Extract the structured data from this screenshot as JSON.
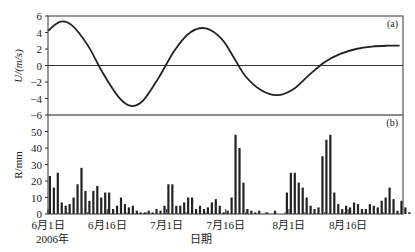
{
  "chart_data": [
    {
      "panel": "(a)",
      "type": "line",
      "ylabel": "U/(m/s)",
      "ylim": [
        -6,
        6
      ],
      "yticks": [
        6,
        4,
        2,
        0,
        -2,
        -4,
        -6
      ],
      "x_unit": "day since 2006-06-01",
      "x": [
        0,
        3,
        6,
        10,
        14,
        18,
        21,
        24,
        28,
        32,
        36,
        40,
        44,
        47,
        50,
        54,
        58,
        62,
        66,
        70,
        74,
        78,
        82,
        86,
        89
      ],
      "y": [
        4.2,
        5.3,
        4.9,
        2.5,
        -1.0,
        -3.9,
        -4.9,
        -4.3,
        -1.5,
        1.8,
        4.0,
        4.5,
        3.2,
        1.0,
        -1.3,
        -3.0,
        -3.6,
        -2.9,
        -1.2,
        0.4,
        1.4,
        2.0,
        2.3,
        2.4,
        2.4
      ],
      "reference_line": 0,
      "color": "#222222"
    },
    {
      "panel": "(b)",
      "type": "bar",
      "ylabel": "R/mm",
      "ylim": [
        0,
        60
      ],
      "yticks": [
        50,
        40,
        30,
        20,
        10,
        0
      ],
      "xlabel": "日期",
      "xtick_labels": [
        "6月1日",
        "6月16日",
        "7月1日",
        "7月16日",
        "8月1日",
        "8月16日"
      ],
      "xtick_days": [
        0,
        15,
        30,
        45,
        61,
        76
      ],
      "year_label": "2006年",
      "values": [
        23,
        16,
        25,
        7,
        5,
        6,
        10,
        18,
        28,
        14,
        8,
        14,
        17,
        10,
        13,
        13,
        3,
        5,
        10,
        6,
        4,
        5,
        2,
        1,
        1,
        2,
        1,
        3,
        2,
        5,
        18,
        18,
        5,
        5,
        7,
        10,
        10,
        3,
        5,
        3,
        4,
        7,
        9,
        5,
        1,
        2,
        10,
        48,
        40,
        19,
        3,
        2,
        1,
        2,
        0,
        1,
        0,
        2,
        0,
        0,
        13,
        25,
        25,
        19,
        16,
        10,
        5,
        3,
        4,
        35,
        45,
        48,
        13,
        6,
        3,
        5,
        4,
        7,
        6,
        3,
        3,
        6,
        5,
        4,
        8,
        10,
        16,
        9,
        2,
        8,
        4,
        1
      ],
      "color": "#222222"
    }
  ],
  "labels": {
    "panel_a": "(a)",
    "panel_b": "(b)",
    "ylabel_a": "U/(m/s)",
    "ylabel_b": "R/mm",
    "xlabel": "日期",
    "year": "2006年"
  }
}
